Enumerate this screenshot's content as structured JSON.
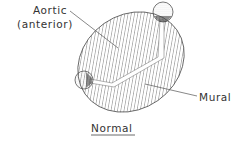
{
  "diagram": {
    "labels": {
      "aortic_line1": "Aortic",
      "aortic_line2": "(anterior)",
      "mural": "Mural",
      "caption": "Normal"
    },
    "colors": {
      "stroke": "#444444",
      "hatch": "#666666",
      "background": "#ffffff"
    },
    "parts": [
      "aortic-leaflet",
      "mural-leaflet",
      "anterolateral-papillary-muscle",
      "posteromedial-papillary-muscle",
      "valve-orifice-slit"
    ]
  }
}
